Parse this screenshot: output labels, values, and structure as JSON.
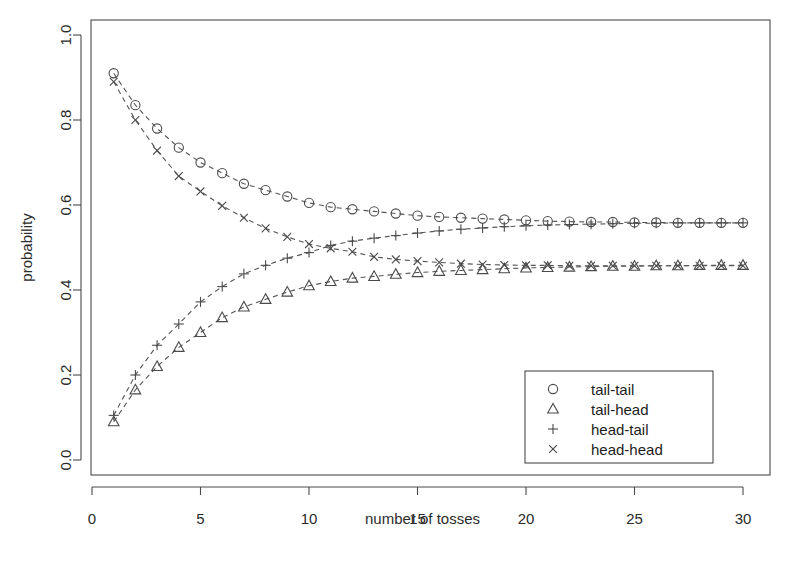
{
  "chart_data": {
    "type": "line",
    "title": "",
    "xlabel": "number of tosses",
    "ylabel": "probability",
    "xlim": [
      0,
      30
    ],
    "ylim": [
      0.0,
      1.0
    ],
    "grid": false,
    "legend_position": "bottom-right",
    "x": [
      1,
      2,
      3,
      4,
      5,
      6,
      7,
      8,
      9,
      10,
      11,
      12,
      13,
      14,
      15,
      16,
      17,
      18,
      19,
      20,
      21,
      22,
      23,
      24,
      25,
      26,
      27,
      28,
      29,
      30
    ],
    "xticks": [
      0,
      5,
      10,
      15,
      20,
      25,
      30
    ],
    "xtick_labels": [
      "0",
      "5",
      "10",
      "15",
      "20",
      "25",
      "30"
    ],
    "yticks": [
      0.0,
      0.2,
      0.4,
      0.6,
      0.8,
      1.0
    ],
    "ytick_labels": [
      "0.0",
      "0.2",
      "0.4",
      "0.6",
      "0.8",
      "1.0"
    ],
    "series": [
      {
        "name": "tail-tail",
        "marker": "circle",
        "values": [
          0.91,
          0.835,
          0.78,
          0.735,
          0.7,
          0.675,
          0.65,
          0.635,
          0.62,
          0.605,
          0.595,
          0.59,
          0.585,
          0.58,
          0.575,
          0.572,
          0.57,
          0.568,
          0.566,
          0.564,
          0.562,
          0.561,
          0.56,
          0.56,
          0.559,
          0.559,
          0.558,
          0.558,
          0.558,
          0.558
        ]
      },
      {
        "name": "tail-head",
        "marker": "triangle",
        "values": [
          0.09,
          0.165,
          0.22,
          0.265,
          0.3,
          0.335,
          0.36,
          0.378,
          0.395,
          0.41,
          0.42,
          0.428,
          0.432,
          0.437,
          0.441,
          0.444,
          0.446,
          0.448,
          0.45,
          0.452,
          0.453,
          0.454,
          0.455,
          0.456,
          0.456,
          0.457,
          0.457,
          0.458,
          0.458,
          0.458
        ]
      },
      {
        "name": "head-tail",
        "marker": "plus",
        "values": [
          0.105,
          0.2,
          0.27,
          0.32,
          0.372,
          0.408,
          0.438,
          0.458,
          0.475,
          0.488,
          0.505,
          0.515,
          0.522,
          0.528,
          0.534,
          0.539,
          0.543,
          0.546,
          0.549,
          0.551,
          0.553,
          0.554,
          0.555,
          0.556,
          0.557,
          0.557,
          0.558,
          0.558,
          0.558,
          0.558
        ]
      },
      {
        "name": "head-head",
        "marker": "cross",
        "values": [
          0.89,
          0.8,
          0.728,
          0.668,
          0.632,
          0.598,
          0.57,
          0.545,
          0.525,
          0.508,
          0.498,
          0.49,
          0.478,
          0.472,
          0.468,
          0.465,
          0.462,
          0.46,
          0.459,
          0.458,
          0.458,
          0.457,
          0.457,
          0.457,
          0.457,
          0.457,
          0.457,
          0.457,
          0.457,
          0.457
        ]
      }
    ],
    "legend": [
      {
        "label": "tail-tail",
        "marker": "circle"
      },
      {
        "label": "tail-head",
        "marker": "triangle"
      },
      {
        "label": "head-tail",
        "marker": "plus"
      },
      {
        "label": "head-head",
        "marker": "cross"
      }
    ],
    "colors": {
      "axis": "#4a4a4a",
      "line": "#555555",
      "marker": "#4a4a4a",
      "text": "#2b2b2b",
      "background": "#ffffff"
    }
  }
}
